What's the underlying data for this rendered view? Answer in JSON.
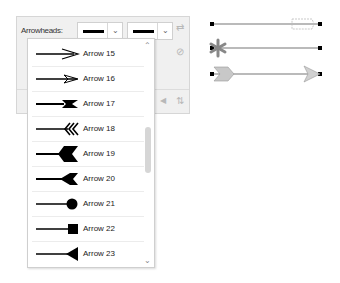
{
  "panel": {
    "label": "Arrowheads:",
    "start_combo": {
      "value": "none-line"
    },
    "end_combo": {
      "value": "none-line"
    },
    "icons": [
      "swap-icon",
      "unlink-icon",
      "left-arrow-icon",
      "flip-icon"
    ]
  },
  "dropdown": {
    "items": [
      {
        "label": "Arrow 15",
        "shape": "open-arrow"
      },
      {
        "label": "Arrow 16",
        "shape": "open-arrow-thin"
      },
      {
        "label": "Arrow 17",
        "shape": "feather"
      },
      {
        "label": "Arrow 18",
        "shape": "chevrons"
      },
      {
        "label": "Arrow 19",
        "shape": "swallowtail-large"
      },
      {
        "label": "Arrow 20",
        "shape": "swallowtail"
      },
      {
        "label": "Arrow 21",
        "shape": "circle"
      },
      {
        "label": "Arrow 22",
        "shape": "square"
      },
      {
        "label": "Arrow 23",
        "shape": "triangle-reverse"
      }
    ]
  },
  "preview": {
    "rows": [
      "hand-pointer",
      "asterisk-flower",
      "fletched-arrow"
    ]
  }
}
